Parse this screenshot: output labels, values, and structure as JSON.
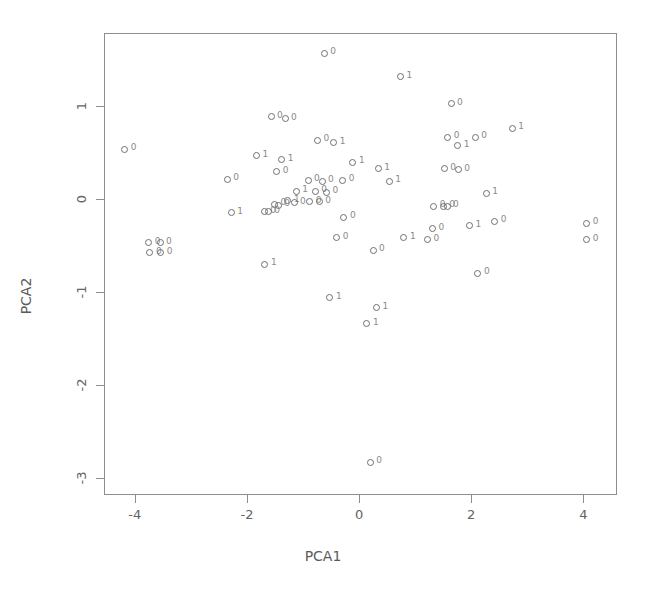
{
  "chart_data": {
    "type": "scatter",
    "title": "",
    "xlabel": "PCA1",
    "ylabel": "PCA2",
    "xlim": [
      -4.55,
      4.6
    ],
    "ylim": [
      -3.18,
      1.78
    ],
    "xticks": [
      -4,
      -2,
      0,
      2,
      4
    ],
    "xticklabels": [
      "-4",
      "-2",
      "0",
      "2",
      "4"
    ],
    "yticks": [
      1,
      0,
      -1,
      -2,
      -3
    ],
    "yticklabels": [
      "1",
      "0",
      "-1",
      "-2",
      "-3"
    ],
    "grid": false,
    "legend": "none",
    "marker": "open-circle",
    "point_label_field": "class",
    "classes": [
      "0",
      "1"
    ],
    "points": [
      {
        "x": -0.62,
        "y": 1.56,
        "label": "0"
      },
      {
        "x": 0.74,
        "y": 1.31,
        "label": "1"
      },
      {
        "x": 1.64,
        "y": 1.02,
        "label": "0"
      },
      {
        "x": -1.57,
        "y": 0.88,
        "label": "0"
      },
      {
        "x": -1.32,
        "y": 0.86,
        "label": "0"
      },
      {
        "x": 2.73,
        "y": 0.76,
        "label": "1"
      },
      {
        "x": 1.58,
        "y": 0.66,
        "label": "0"
      },
      {
        "x": 2.07,
        "y": 0.66,
        "label": "0"
      },
      {
        "x": -0.74,
        "y": 0.63,
        "label": "0"
      },
      {
        "x": -0.45,
        "y": 0.6,
        "label": "1"
      },
      {
        "x": 1.76,
        "y": 0.57,
        "label": "1"
      },
      {
        "x": -4.18,
        "y": 0.53,
        "label": "0"
      },
      {
        "x": -1.83,
        "y": 0.46,
        "label": "1"
      },
      {
        "x": -1.38,
        "y": 0.42,
        "label": "1"
      },
      {
        "x": -0.11,
        "y": 0.39,
        "label": "1"
      },
      {
        "x": 0.34,
        "y": 0.32,
        "label": "1"
      },
      {
        "x": -1.47,
        "y": 0.29,
        "label": "0"
      },
      {
        "x": 1.52,
        "y": 0.32,
        "label": "0"
      },
      {
        "x": 1.77,
        "y": 0.31,
        "label": "0"
      },
      {
        "x": -2.35,
        "y": 0.21,
        "label": "0"
      },
      {
        "x": -0.91,
        "y": 0.2,
        "label": "0"
      },
      {
        "x": -0.66,
        "y": 0.19,
        "label": "0"
      },
      {
        "x": -0.29,
        "y": 0.2,
        "label": "0"
      },
      {
        "x": 0.54,
        "y": 0.19,
        "label": "1"
      },
      {
        "x": -1.12,
        "y": 0.08,
        "label": "1"
      },
      {
        "x": -0.78,
        "y": 0.08,
        "label": "0"
      },
      {
        "x": -0.58,
        "y": 0.07,
        "label": "0"
      },
      {
        "x": 2.27,
        "y": 0.06,
        "label": "1"
      },
      {
        "x": -1.27,
        "y": -0.02,
        "label": "1"
      },
      {
        "x": -1.16,
        "y": -0.04,
        "label": "0"
      },
      {
        "x": -0.88,
        "y": -0.03,
        "label": "0"
      },
      {
        "x": -0.71,
        "y": -0.03,
        "label": "0"
      },
      {
        "x": -1.51,
        "y": -0.06,
        "label": "0"
      },
      {
        "x": -1.44,
        "y": -0.07,
        "label": "0"
      },
      {
        "x": 1.33,
        "y": -0.08,
        "label": "0"
      },
      {
        "x": 1.5,
        "y": -0.08,
        "label": "0"
      },
      {
        "x": 1.57,
        "y": -0.08,
        "label": "0"
      },
      {
        "x": -2.28,
        "y": -0.15,
        "label": "1"
      },
      {
        "x": -1.69,
        "y": -0.14,
        "label": "0"
      },
      {
        "x": -1.62,
        "y": -0.14,
        "label": "0"
      },
      {
        "x": -0.27,
        "y": -0.2,
        "label": "0"
      },
      {
        "x": 2.42,
        "y": -0.24,
        "label": "0"
      },
      {
        "x": 4.06,
        "y": -0.26,
        "label": "0"
      },
      {
        "x": 1.31,
        "y": -0.32,
        "label": "0"
      },
      {
        "x": 1.97,
        "y": -0.29,
        "label": "1"
      },
      {
        "x": -3.75,
        "y": -0.47,
        "label": "0"
      },
      {
        "x": -3.55,
        "y": -0.47,
        "label": "0"
      },
      {
        "x": 4.06,
        "y": -0.44,
        "label": "0"
      },
      {
        "x": -0.4,
        "y": -0.42,
        "label": "0"
      },
      {
        "x": 0.8,
        "y": -0.42,
        "label": "1"
      },
      {
        "x": 1.22,
        "y": -0.44,
        "label": "0"
      },
      {
        "x": -3.73,
        "y": -0.58,
        "label": "0"
      },
      {
        "x": -3.54,
        "y": -0.58,
        "label": "0"
      },
      {
        "x": 0.25,
        "y": -0.55,
        "label": "0"
      },
      {
        "x": 2.12,
        "y": -0.8,
        "label": "0"
      },
      {
        "x": -1.68,
        "y": -0.7,
        "label": "1"
      },
      {
        "x": -0.52,
        "y": -1.06,
        "label": "1"
      },
      {
        "x": 0.31,
        "y": -1.17,
        "label": "1"
      },
      {
        "x": 0.14,
        "y": -1.34,
        "label": "1"
      },
      {
        "x": 0.2,
        "y": -2.83,
        "label": "0"
      }
    ]
  },
  "axis": {
    "xlabel": "PCA1",
    "ylabel": "PCA2"
  }
}
